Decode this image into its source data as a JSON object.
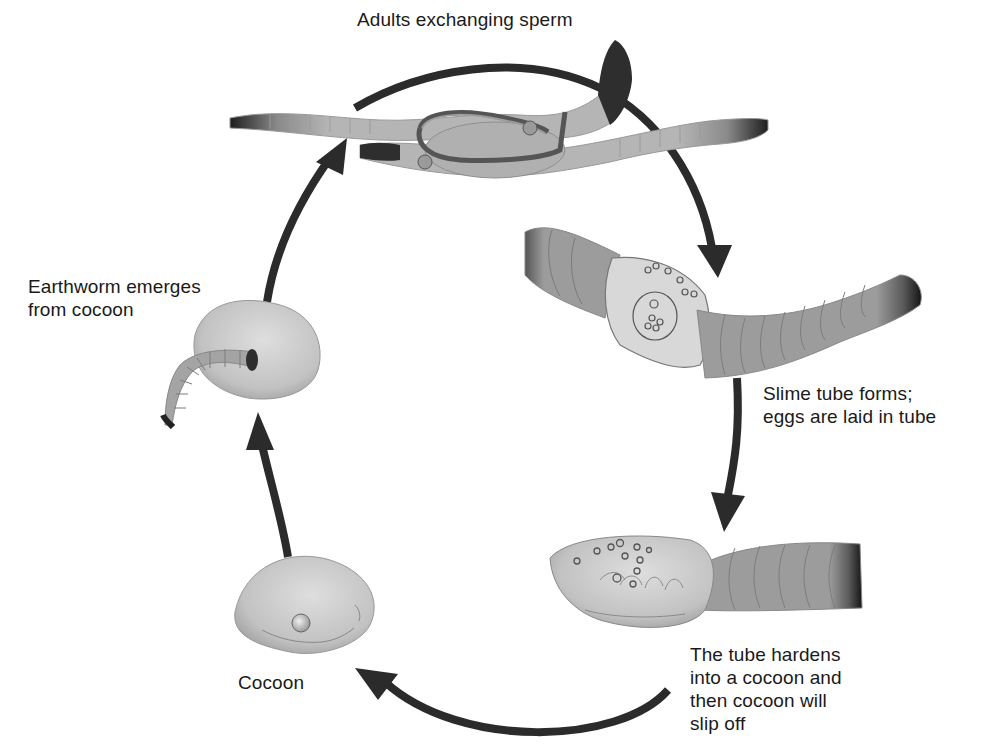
{
  "diagram": {
    "type": "cycle",
    "colors": {
      "arrow": "#2b2b2b",
      "worm_light": "#b4b4b4",
      "worm_mid": "#9a9a9a",
      "worm_dark": "#2a2a2a",
      "cocoon": "#c8c8c8",
      "background": "#ffffff"
    },
    "stages": [
      {
        "id": "adults",
        "label": "Adults exchanging sperm",
        "icon": "mating-earthworms-icon"
      },
      {
        "id": "slime",
        "label": "Slime tube forms;\neggs are laid in tube",
        "icon": "slime-tube-worm-icon"
      },
      {
        "id": "harden",
        "label": "The tube hardens\ninto a cocoon and\nthen cocoon will\nslip off",
        "icon": "hardening-cocoon-worm-icon"
      },
      {
        "id": "cocoon",
        "label": "Cocoon",
        "icon": "cocoon-icon"
      },
      {
        "id": "emerge",
        "label": "Earthworm emerges\nfrom cocoon",
        "icon": "emerging-earthworm-icon"
      }
    ],
    "arrows": [
      {
        "from": "adults",
        "to": "slime"
      },
      {
        "from": "slime",
        "to": "harden"
      },
      {
        "from": "harden",
        "to": "cocoon"
      },
      {
        "from": "cocoon",
        "to": "emerge"
      },
      {
        "from": "emerge",
        "to": "adults"
      }
    ]
  }
}
